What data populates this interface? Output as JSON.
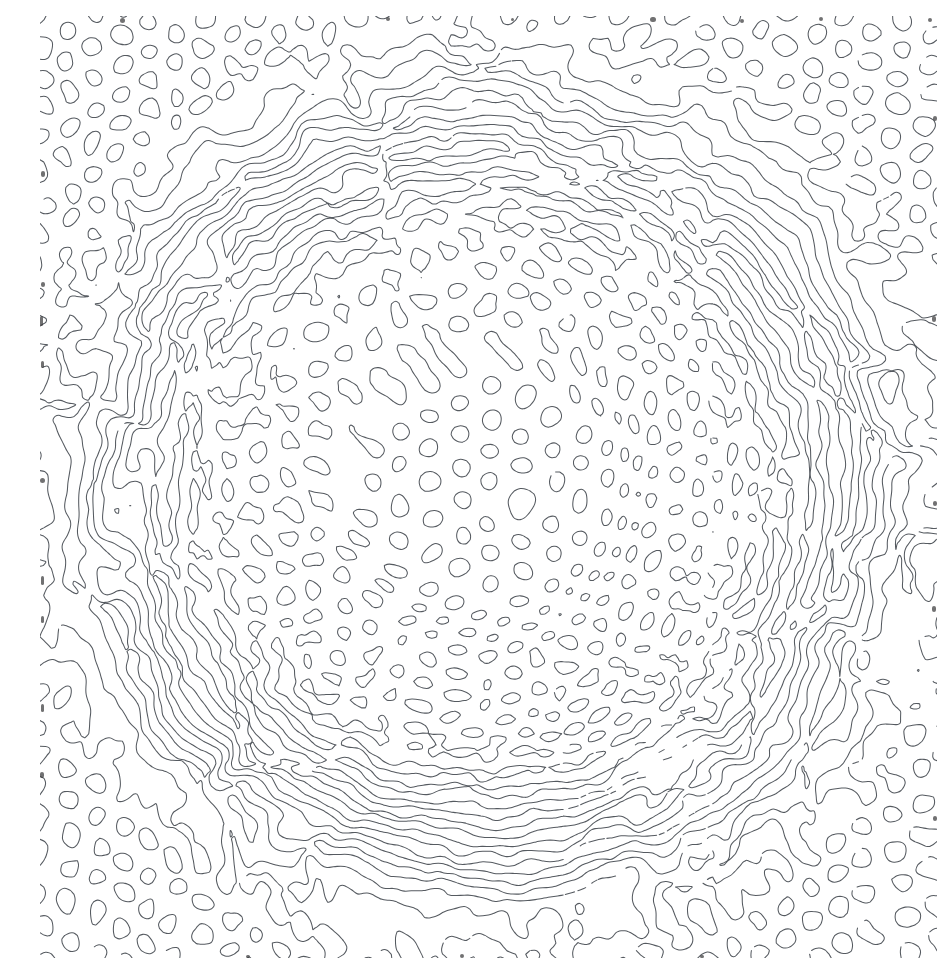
{
  "figure": {
    "caption": "Radially graded Turing pattern: isolated spots at the periphery, labyrinthine stripes in the mid-annulus, sparse small spots at the core."
  },
  "canvas": {
    "width": 897,
    "height": 942,
    "background_color": "#ffffff",
    "stroke_color": "#555a60",
    "stroke_width": 1.05,
    "edge_speck_color": "#3a3a3c"
  },
  "chart_data": {
    "type": "heatmap",
    "xlabel": "",
    "ylabel": "",
    "grid": false,
    "legend_position": "none",
    "field": {
      "model": "gray-scott",
      "contour_level": 0.5,
      "render_mode": "iso-contour-outline",
      "grid_cells_x": 240,
      "grid_cells_y": 252
    },
    "center": {
      "x": 448,
      "y": 471
    },
    "radial_zones": [
      {
        "name": "core-spots",
        "r_inner": 0,
        "r_outer": 110,
        "morphology": "spots",
        "feature_diameter_px": 11,
        "spacing_px": 26,
        "stripe_fraction": 0.08
      },
      {
        "name": "inner-transition",
        "r_inner": 110,
        "r_outer": 175,
        "morphology": "mixed",
        "feature_diameter_px": 12,
        "spacing_px": 24,
        "stripe_fraction": 0.45
      },
      {
        "name": "labyrinth-annulus",
        "r_inner": 175,
        "r_outer": 400,
        "morphology": "stripes",
        "feature_diameter_px": 10,
        "spacing_px": 21,
        "stripe_fraction": 0.97
      },
      {
        "name": "outer-transition",
        "r_inner": 400,
        "r_outer": 500,
        "morphology": "mixed",
        "feature_diameter_px": 15,
        "spacing_px": 23,
        "stripe_fraction": 0.42
      },
      {
        "name": "peripheral-spots",
        "r_inner": 500,
        "r_outer": 760,
        "morphology": "spots",
        "feature_diameter_px": 17,
        "spacing_px": 24,
        "stripe_fraction": 0.07
      }
    ],
    "x": [
      0,
      110,
      175,
      400,
      500,
      760
    ],
    "series": [
      {
        "name": "stripe_fraction_vs_radius",
        "values": [
          0.08,
          0.45,
          0.97,
          0.42,
          0.07,
          0.05
        ]
      },
      {
        "name": "feature_diameter_px_vs_radius",
        "values": [
          11,
          12,
          10,
          15,
          17,
          17
        ]
      },
      {
        "name": "spacing_px_vs_radius",
        "values": [
          26,
          24,
          21,
          23,
          24,
          24
        ]
      }
    ],
    "xlim": [
      0,
      760
    ],
    "ylim": [
      0,
      1
    ]
  },
  "generation": {
    "seed": 20240517,
    "wavelength_px": 21,
    "noise_octaves": 4,
    "orientation_field": "radial-tangential",
    "smoothing_passes": 3
  },
  "edge_specks": [
    {
      "x": 80,
      "y": 2,
      "w": 5,
      "h": 5
    },
    {
      "x": 346,
      "y": 1,
      "w": 4,
      "h": 4
    },
    {
      "x": 471,
      "y": 2,
      "w": 3,
      "h": 3
    },
    {
      "x": 610,
      "y": 1,
      "w": 6,
      "h": 5
    },
    {
      "x": 700,
      "y": 3,
      "w": 4,
      "h": 4
    },
    {
      "x": 779,
      "y": 1,
      "w": 4,
      "h": 4
    },
    {
      "x": 888,
      "y": 2,
      "w": 4,
      "h": 4
    },
    {
      "x": 1,
      "y": 155,
      "w": 4,
      "h": 6
    },
    {
      "x": 1,
      "y": 266,
      "w": 4,
      "h": 5
    },
    {
      "x": 0,
      "y": 300,
      "w": 3,
      "h": 10
    },
    {
      "x": 1,
      "y": 345,
      "w": 3,
      "h": 7
    },
    {
      "x": 0,
      "y": 462,
      "w": 5,
      "h": 5
    },
    {
      "x": 1,
      "y": 560,
      "w": 3,
      "h": 9
    },
    {
      "x": 1,
      "y": 600,
      "w": 3,
      "h": 7
    },
    {
      "x": 1,
      "y": 688,
      "w": 3,
      "h": 8
    },
    {
      "x": 0,
      "y": 756,
      "w": 4,
      "h": 6
    },
    {
      "x": 893,
      "y": 100,
      "w": 4,
      "h": 5
    },
    {
      "x": 892,
      "y": 300,
      "w": 4,
      "h": 6
    },
    {
      "x": 893,
      "y": 485,
      "w": 4,
      "h": 5
    },
    {
      "x": 892,
      "y": 590,
      "w": 4,
      "h": 6
    },
    {
      "x": 893,
      "y": 800,
      "w": 4,
      "h": 5
    },
    {
      "x": 420,
      "y": 938,
      "w": 4,
      "h": 4
    },
    {
      "x": 660,
      "y": 939,
      "w": 4,
      "h": 3
    },
    {
      "x": 206,
      "y": 939,
      "w": 4,
      "h": 3
    }
  ]
}
